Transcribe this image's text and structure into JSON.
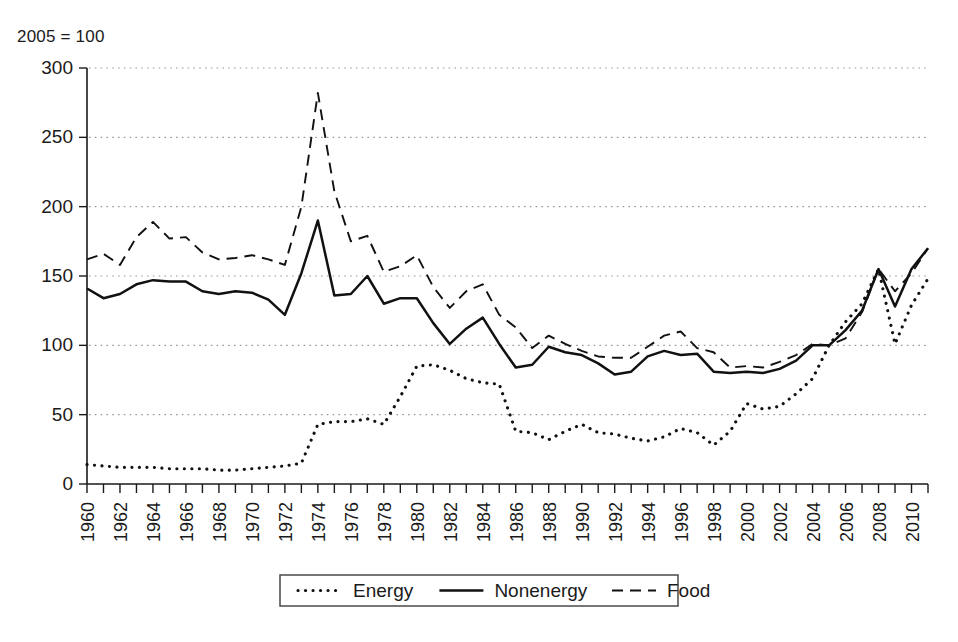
{
  "figure": {
    "unit_note": "2005 = 100",
    "background": "#ffffff",
    "ink": "#111111"
  },
  "chart_data": {
    "type": "line",
    "title": "",
    "subtitle": "",
    "annotation": "2005 = 100",
    "xlabel": "",
    "ylabel": "",
    "xlim": [
      1960,
      2011
    ],
    "ylim": [
      0,
      300
    ],
    "yticks": [
      0,
      50,
      100,
      150,
      200,
      250,
      300
    ],
    "xticks": [
      1960,
      1962,
      1964,
      1966,
      1968,
      1970,
      1972,
      1974,
      1976,
      1978,
      1980,
      1982,
      1984,
      1986,
      1988,
      1990,
      1992,
      1994,
      1996,
      1998,
      2000,
      2002,
      2004,
      2006,
      2008,
      2010
    ],
    "xtick_rotation": 90,
    "grid": "horizontal-dotted",
    "legend_position": "bottom-center",
    "x": [
      1960,
      1961,
      1962,
      1963,
      1964,
      1965,
      1966,
      1967,
      1968,
      1969,
      1970,
      1971,
      1972,
      1973,
      1974,
      1975,
      1976,
      1977,
      1978,
      1979,
      1980,
      1981,
      1982,
      1983,
      1984,
      1985,
      1986,
      1987,
      1988,
      1989,
      1990,
      1991,
      1992,
      1993,
      1994,
      1995,
      1996,
      1997,
      1998,
      1999,
      2000,
      2001,
      2002,
      2003,
      2004,
      2005,
      2006,
      2007,
      2008,
      2009,
      2010,
      2011
    ],
    "series": [
      {
        "name": "Energy",
        "style": "dotted",
        "values": [
          14,
          13,
          12,
          12,
          12,
          11,
          11,
          11,
          10,
          10,
          11,
          12,
          13,
          15,
          43,
          45,
          45,
          47,
          43,
          63,
          85,
          86,
          82,
          76,
          73,
          72,
          38,
          37,
          32,
          38,
          43,
          37,
          36,
          33,
          31,
          34,
          40,
          37,
          28,
          38,
          58,
          54,
          56,
          65,
          76,
          100,
          117,
          130,
          155,
          101,
          129,
          148
        ]
      },
      {
        "name": "Nonenergy",
        "style": "solid",
        "values": [
          141,
          134,
          137,
          144,
          147,
          146,
          146,
          139,
          137,
          139,
          138,
          133,
          122,
          152,
          190,
          136,
          137,
          150,
          130,
          134,
          134,
          116,
          101,
          112,
          120,
          101,
          84,
          86,
          99,
          95,
          93,
          87,
          79,
          81,
          92,
          96,
          93,
          94,
          81,
          80,
          81,
          80,
          83,
          89,
          100,
          100,
          111,
          125,
          155,
          128,
          155,
          170
        ]
      },
      {
        "name": "Food",
        "style": "dashed",
        "values": [
          162,
          166,
          158,
          178,
          189,
          177,
          178,
          167,
          162,
          163,
          165,
          162,
          158,
          200,
          282,
          211,
          175,
          179,
          153,
          157,
          165,
          142,
          127,
          139,
          144,
          122,
          113,
          98,
          107,
          101,
          96,
          92,
          91,
          91,
          99,
          107,
          110,
          98,
          95,
          84,
          85,
          84,
          88,
          93,
          101,
          100,
          105,
          124,
          155,
          139,
          152,
          170
        ]
      }
    ]
  },
  "legend": {
    "items": [
      {
        "label": "Energy",
        "style": "dotted"
      },
      {
        "label": "Nonenergy",
        "style": "solid"
      },
      {
        "label": "Food",
        "style": "dashed"
      }
    ]
  }
}
